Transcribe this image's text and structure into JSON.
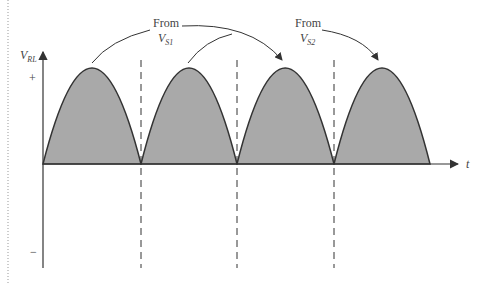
{
  "diagram": {
    "y_axis_label": "V",
    "y_axis_sub": "RL",
    "x_axis_label": "t",
    "plus_label": "+",
    "minus_label": "−",
    "annotations": [
      {
        "text": "From",
        "source": "V",
        "sub": "S1"
      },
      {
        "text": "From",
        "source": "V",
        "sub": "S2"
      }
    ],
    "pulses": 4,
    "colors": {
      "fill": "#a9a9a9",
      "stroke": "#333333"
    }
  }
}
